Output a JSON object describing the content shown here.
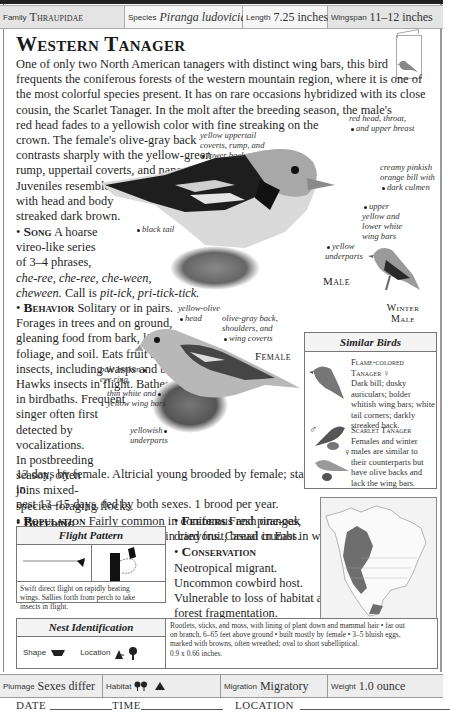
{
  "header": {
    "family": {
      "label": "Family",
      "value": "Thraupidae"
    },
    "species": {
      "label": "Species",
      "value": "Piranga ludoviciana"
    },
    "length": {
      "label": "Length",
      "value": "7.25 inches"
    },
    "wingspan": {
      "label": "Wingspan",
      "value": "11–12 inches"
    }
  },
  "title": "Western Tanager",
  "intro": "One of only two North American tanagers with distinct wing bars, this bird frequents the coniferous forests of the western mountain region, where it is one of the most colorful species present. It has on rare occasions hybridized with its close cousin, the Scarlet Tanager. In the molt after the breeding season, the male's red head fades to a yellowish color with fine streaking on the crown. The female's olive-gray back contrasts sharply with the yellow-green rump, uppertail coverts, and nape. Juveniles resemble females but with head and body streaked dark brown.",
  "intro_lines": [
    "One of only two North American tanagers with distinct wing bars, this bird",
    "frequents the coniferous forests of the western mountain region, where it is one of",
    "the most colorful species present. It has on rare occasions hybridized with its close",
    "cousin, the Scarlet Tanager. In the molt after the breeding season, the male's",
    "red head fades to a yellowish color with fine streaking on the",
    "crown. The female's olive-gray back",
    "contrasts sharply with the yellow-green",
    "rump, uppertail coverts, and nape.",
    "Juveniles resemble females but",
    "with head and body",
    "streaked dark brown."
  ],
  "sections": {
    "song": {
      "heading": "Song",
      "lines": [
        "A hoarse",
        "vireo-like series",
        "of 3–4 phrases,"
      ],
      "calls_italic": "che-ree, che-ree, che-ween,",
      "calls_line2_italic": "cheween.",
      "call_prefix": "Call is",
      "call_italic": "pit-ick, pri-tick-tick."
    },
    "behavior": {
      "heading": "Behavior",
      "lines": [
        "Solitary or in pairs.",
        "Forages in trees and on ground,",
        "gleaning food from bark, limbs,",
        "foliage, and soil. Eats fruit and",
        "insects, including wasps and bees.",
        "Hawks insects in flight. Bathes",
        "in birdbaths. Frequent",
        "singer often first",
        "detected by",
        "vocalizations.",
        "In postbreeding",
        "season, often",
        "joins mixed-",
        "species foraging flocks."
      ]
    },
    "breeding": {
      "heading": "Breeding",
      "text": "Monogamous. Solitary."
    },
    "nesting": {
      "heading": "Nesting",
      "first": "Incubation",
      "lines": [
        "13 days by female. Altricial young brooded by female; stay in",
        "nest 13–15 days, fed by both sexes. 1 brood per year."
      ]
    },
    "population": {
      "heading": "Population",
      "lines": [
        "Fairly common in coniferous and pine-oak",
        "forests, particularly in mountain canyons. Casual in East in winter."
      ]
    },
    "feeders": {
      "heading": "Feeders",
      "lines": [
        "Fresh oranges,",
        "dried fruit, bread crumbs."
      ]
    },
    "conservation": {
      "heading": "Conservation",
      "lines": [
        "Neotropical migrant.",
        "Uncommon cowbird host.",
        "Vulnerable to loss of habitat and",
        "forest fragmentation."
      ]
    }
  },
  "male_labels": {
    "uppertail": [
      "yellow uppertail",
      "coverts, rump, and",
      "lower back"
    ],
    "head": [
      "red head, throat,",
      "and upper breast"
    ],
    "bill": [
      "creamy pinkish",
      "orange bill with",
      "dark culmen"
    ],
    "wingbars": [
      "upper",
      "yellow and",
      "lower white",
      "wing bars"
    ],
    "underparts": [
      "yellow",
      "underparts"
    ],
    "tail": [
      "black tail"
    ],
    "caption": "Male"
  },
  "winter_male_caption": [
    "Winter",
    "Male"
  ],
  "female_labels": {
    "head": [
      "yellow-olive",
      "head"
    ],
    "back": [
      "olive-gray back,",
      "shoulders, and",
      "wing coverts"
    ],
    "eye": [
      "pale broken",
      "eye ring"
    ],
    "wingbars": [
      "thin white and",
      "yellow wing bars"
    ],
    "underparts": [
      "yellowish",
      "underparts"
    ],
    "caption": "Female"
  },
  "similar_birds": {
    "title": "Similar Birds",
    "items": [
      {
        "name": "Flame-colored Tanager",
        "sex_symbol": "♀",
        "lines": [
          "Dark bill; dusky",
          "auriculars; bolder",
          "whitish wing bars; white",
          "tail corners; darkly",
          "streaked back."
        ]
      },
      {
        "name": "Scarlet Tanager",
        "sex_symbols": [
          "♂",
          "♀"
        ],
        "lines": [
          "Females and winter",
          "males are similar to",
          "their counterparts but",
          "have olive backs and",
          "lack the wing bars."
        ]
      }
    ]
  },
  "flight_pattern": {
    "title": "Flight Pattern",
    "description_lines": [
      "Swift direct flight on rapidly beating",
      "wings. Sallies forth from perch to take",
      "insects in flight."
    ]
  },
  "nest_identification": {
    "title": "Nest Identification",
    "shape_label": "Shape",
    "location_label": "Location",
    "description_lines": [
      "Rootlets, sticks, and moss, with lining of plant down and mammal hair • far out",
      "on branch, 6–65 feet above ground • built mostly by female • 3–5 bluish eggs,",
      "marked with browns, often wreathed; oval to short subelliptical.",
      "0.9 x 0.66 inches."
    ]
  },
  "footer": {
    "plumage": {
      "label": "Plumage",
      "value": "Sexes differ"
    },
    "habitat": {
      "label": "Habitat",
      "icons": [
        "forest-icon",
        "mountain-icon"
      ]
    },
    "migration": {
      "label": "Migration",
      "value": "Migratory"
    },
    "weight": {
      "label": "Weight",
      "value": "1.0 ounce"
    }
  },
  "log": {
    "date": "DATE",
    "time": "TIME",
    "location": "LOCATION"
  },
  "colors": {
    "header_bg": "#e8e8e8",
    "range_fill": "#6e6e6e",
    "border": "#777777"
  }
}
